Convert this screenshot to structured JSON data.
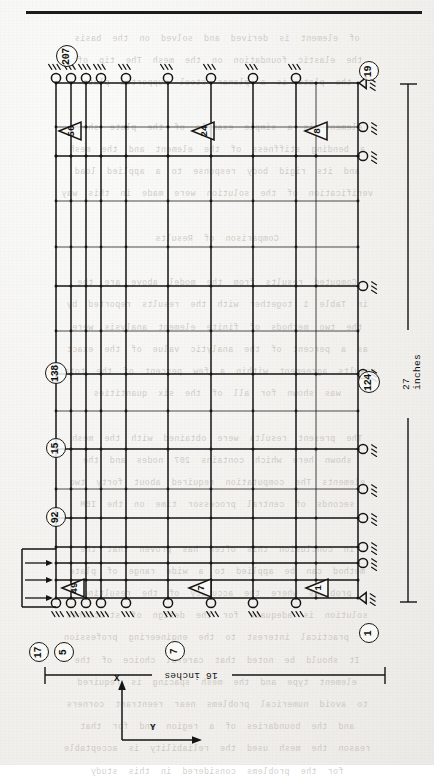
{
  "page": {
    "kind": "scanned-figure",
    "ink_color": "#141414",
    "paper_color": "#f3f2ef",
    "ghost_color": "#b9b3ab"
  },
  "figure": {
    "dimensions": {
      "horizontal_label": "16 inches",
      "vertical_label": "27 inches"
    },
    "axes": {
      "x_label": "X",
      "y_label": "Y"
    },
    "node_labels": [
      {
        "id": "n207",
        "text": "207",
        "x": 66,
        "y": 55
      },
      {
        "id": "n19",
        "text": "19",
        "x": 368,
        "y": 70
      },
      {
        "id": "n138",
        "text": "138",
        "x": 55,
        "y": 372
      },
      {
        "id": "n124",
        "text": "124",
        "x": 368,
        "y": 381
      },
      {
        "id": "n15",
        "text": "15",
        "x": 55,
        "y": 447
      },
      {
        "id": "n92",
        "text": "92",
        "x": 55,
        "y": 516
      },
      {
        "id": "n17",
        "text": "17",
        "x": 38,
        "y": 651
      },
      {
        "id": "n5",
        "text": "5",
        "x": 63,
        "y": 651
      },
      {
        "id": "n7",
        "text": "7",
        "x": 174,
        "y": 650
      },
      {
        "id": "n1",
        "text": "1",
        "x": 368,
        "y": 632
      }
    ],
    "element_labels": [
      {
        "id": "e56",
        "text": "56",
        "x": 70,
        "y": 131
      },
      {
        "id": "e24",
        "text": "24",
        "x": 203,
        "y": 131
      },
      {
        "id": "e8",
        "text": "8",
        "x": 316,
        "y": 131
      },
      {
        "id": "e49",
        "text": "49",
        "x": 73,
        "y": 588
      },
      {
        "id": "e7",
        "text": "7",
        "x": 200,
        "y": 588
      },
      {
        "id": "e1",
        "text": "1",
        "x": 317,
        "y": 588
      }
    ],
    "mesh": {
      "x_cols": [
        56,
        71,
        86,
        101,
        126,
        168,
        211,
        253,
        296,
        316,
        358
      ],
      "y_rows": [
        83,
        127,
        156,
        201,
        247,
        286,
        331,
        374,
        411,
        449,
        489,
        518,
        547,
        563,
        580,
        598
      ],
      "heavy_x": [
        56,
        71,
        86,
        101,
        126,
        168,
        211,
        253,
        296,
        358
      ],
      "heavy_y": [
        83,
        156,
        286,
        374,
        449,
        518,
        547,
        563,
        580,
        598
      ]
    },
    "supports": {
      "top_rollers_x": [
        56,
        71,
        86,
        101,
        126,
        168,
        211,
        253,
        296
      ],
      "bottom_rollers_x": [
        56,
        71,
        86,
        101,
        126,
        168,
        211,
        253,
        296
      ],
      "right_rollers_y": [
        127,
        156,
        286,
        374,
        449,
        489,
        518,
        547,
        563
      ],
      "pin_supports_y": [
        83,
        598
      ]
    },
    "load_arrows_y": [
      563,
      580,
      598
    ]
  },
  "ghost_text": {
    "note": "faint mirrored bleed-through from the reverse of the scanned page",
    "lines": [
      "of  element  is  derived  and  solved  on  the  basis",
      "the  elastic  foundation  on  the  mesh  The  tip  off",
      "the  plate  is  a  planar  steel  supported  plate",
      "",
      "element  is  a  simple  example  of  the  plate  shown",
      "a  bending  stiffness  of  the  element  and  the  mesh",
      "and  its  rigid  body  response  to  a  applied  load",
      "verification  of  the  solution  were  made  in  this  way",
      "",
      "Comparison  of  Results",
      "",
      "Computed  results  from  the  model  above  are  the",
      "in  Table  1  together  with  the  results  reported  by",
      "the  two  methods  of  finite  element  analysis  were",
      "as  a  percent  of  the  analytic  value  of  the  exact",
      "results  agreement  within  a  few  percent  of  the  total",
      "was  shown  for  all  of  the  six  quantities",
      "",
      "The  present  results  were  obtained  with  the  mesh",
      "shown  here  which  contains  207  nodes  and  the",
      "elements  The  computation  required  about  forty  two",
      "seconds  of  central  processor  time  on  the  IBM",
      "",
      "In  conclusion  this  often  has  proven  that  the",
      "method  can  be  applied  to  a  wide  range  of  plate",
      "problems  where  the  accuracy  of  the  resulting",
      "solution  is  adequate  for  the  design  of  structures",
      "of  practical  interest  to  the  engineering  profession",
      "It  should  be  noted  that  careful  choice  of  the",
      "element  type  and  the  mesh  spacing  is  required",
      "to  avoid  numerical  problems  near  reentrant  corners",
      "and  the  boundaries  of  a  region  and  for  that",
      "reason  the  mesh  used  the  reliability  is  acceptable",
      "for  the  problems  considered  in  this  study"
    ]
  }
}
